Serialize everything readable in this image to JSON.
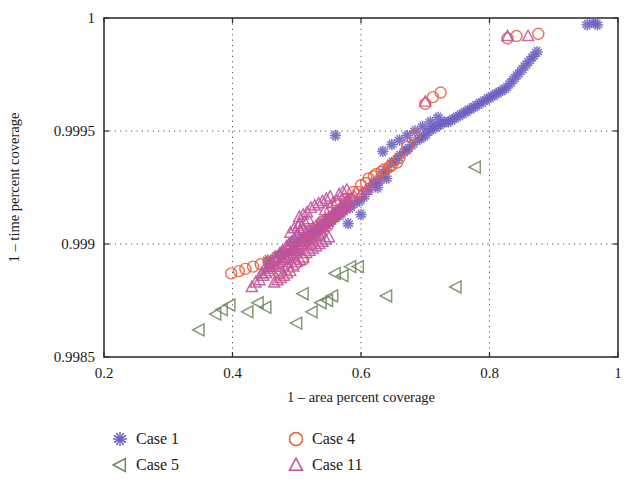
{
  "chart_data": {
    "type": "scatter",
    "title": "",
    "xlabel": "1 – area percent coverage",
    "ylabel": "1 – time percent coverage",
    "xlim": [
      0.2,
      1.0
    ],
    "ylim": [
      0.9985,
      1.0
    ],
    "xticks": [
      "0.2",
      "0.4",
      "0.6",
      "0.8",
      "1"
    ],
    "xtick_values": [
      0.2,
      0.4,
      0.6,
      0.8,
      1.0
    ],
    "yticks": [
      "0.9985",
      "0.999",
      "0.9995",
      "1"
    ],
    "ytick_values": [
      0.9985,
      0.999,
      0.9995,
      1.0
    ],
    "grid": "dotted",
    "grid_color": "#555555",
    "legend_position": "below-plot",
    "series": [
      {
        "name": "Case 1",
        "marker": "asterisk",
        "color": "#6b5fbf",
        "points": [
          [
            0.455,
            0.99893
          ],
          [
            0.47,
            0.99895
          ],
          [
            0.478,
            0.99896
          ],
          [
            0.492,
            0.999
          ],
          [
            0.5,
            0.99901
          ],
          [
            0.508,
            0.99903
          ],
          [
            0.515,
            0.99903
          ],
          [
            0.523,
            0.99905
          ],
          [
            0.53,
            0.99906
          ],
          [
            0.538,
            0.99907
          ],
          [
            0.545,
            0.99908
          ],
          [
            0.552,
            0.9991
          ],
          [
            0.56,
            0.99912
          ],
          [
            0.568,
            0.99913
          ],
          [
            0.575,
            0.99915
          ],
          [
            0.56,
            0.99948
          ],
          [
            0.583,
            0.99916
          ],
          [
            0.59,
            0.99918
          ],
          [
            0.598,
            0.99919
          ],
          [
            0.605,
            0.99921
          ],
          [
            0.612,
            0.99924
          ],
          [
            0.62,
            0.99927
          ],
          [
            0.628,
            0.99928
          ],
          [
            0.634,
            0.99931
          ],
          [
            0.64,
            0.99933
          ],
          [
            0.648,
            0.99936
          ],
          [
            0.654,
            0.99937
          ],
          [
            0.66,
            0.99939
          ],
          [
            0.668,
            0.99941
          ],
          [
            0.673,
            0.99942
          ],
          [
            0.68,
            0.99944
          ],
          [
            0.688,
            0.99946
          ],
          [
            0.694,
            0.99947
          ],
          [
            0.7,
            0.99948
          ],
          [
            0.706,
            0.9995
          ],
          [
            0.712,
            0.99951
          ],
          [
            0.718,
            0.99952
          ],
          [
            0.724,
            0.99953
          ],
          [
            0.73,
            0.99954
          ],
          [
            0.736,
            0.99954
          ],
          [
            0.742,
            0.99955
          ],
          [
            0.748,
            0.99956
          ],
          [
            0.754,
            0.99957
          ],
          [
            0.76,
            0.99958
          ],
          [
            0.766,
            0.99959
          ],
          [
            0.772,
            0.9996
          ],
          [
            0.778,
            0.99961
          ],
          [
            0.784,
            0.99962
          ],
          [
            0.79,
            0.99963
          ],
          [
            0.796,
            0.99964
          ],
          [
            0.802,
            0.99965
          ],
          [
            0.808,
            0.99966
          ],
          [
            0.814,
            0.99967
          ],
          [
            0.82,
            0.99968
          ],
          [
            0.826,
            0.99969
          ],
          [
            0.832,
            0.99971
          ],
          [
            0.838,
            0.99973
          ],
          [
            0.844,
            0.99975
          ],
          [
            0.85,
            0.99977
          ],
          [
            0.856,
            0.99979
          ],
          [
            0.862,
            0.99981
          ],
          [
            0.868,
            0.99983
          ],
          [
            0.874,
            0.99985
          ],
          [
            0.952,
            0.99997
          ],
          [
            0.962,
            0.99998
          ],
          [
            0.968,
            0.99997
          ],
          [
            0.634,
            0.99941
          ],
          [
            0.648,
            0.99944
          ],
          [
            0.66,
            0.99946
          ],
          [
            0.672,
            0.99948
          ],
          [
            0.684,
            0.9995
          ],
          [
            0.696,
            0.99952
          ],
          [
            0.708,
            0.99954
          ],
          [
            0.72,
            0.99956
          ],
          [
            0.626,
            0.99925
          ],
          [
            0.64,
            0.99929
          ],
          [
            0.6,
            0.99913
          ],
          [
            0.58,
            0.99909
          ]
        ]
      },
      {
        "name": "Case 4",
        "marker": "circle",
        "color": "#e8603c",
        "points": [
          [
            0.398,
            0.99887
          ],
          [
            0.41,
            0.99888
          ],
          [
            0.42,
            0.99889
          ],
          [
            0.432,
            0.9989
          ],
          [
            0.444,
            0.99891
          ],
          [
            0.456,
            0.99892
          ],
          [
            0.468,
            0.99894
          ],
          [
            0.48,
            0.99896
          ],
          [
            0.492,
            0.99898
          ],
          [
            0.504,
            0.999
          ],
          [
            0.516,
            0.99903
          ],
          [
            0.528,
            0.99906
          ],
          [
            0.54,
            0.9991
          ],
          [
            0.552,
            0.99914
          ],
          [
            0.564,
            0.99917
          ],
          [
            0.576,
            0.9992
          ],
          [
            0.588,
            0.99923
          ],
          [
            0.6,
            0.99926
          ],
          [
            0.612,
            0.99929
          ],
          [
            0.624,
            0.99931
          ],
          [
            0.636,
            0.99933
          ],
          [
            0.648,
            0.99935
          ],
          [
            0.66,
            0.99938
          ],
          [
            0.672,
            0.99943
          ],
          [
            0.684,
            0.99948
          ],
          [
            0.7,
            0.99962
          ],
          [
            0.712,
            0.99965
          ],
          [
            0.724,
            0.99967
          ],
          [
            0.828,
            0.99991
          ],
          [
            0.842,
            0.99992
          ],
          [
            0.876,
            0.99993
          ],
          [
            0.524,
            0.999
          ],
          [
            0.536,
            0.99904
          ],
          [
            0.548,
            0.99908
          ],
          [
            0.56,
            0.99912
          ],
          [
            0.572,
            0.99916
          ],
          [
            0.584,
            0.9992
          ],
          [
            0.596,
            0.99923
          ],
          [
            0.608,
            0.99927
          ],
          [
            0.62,
            0.9993
          ],
          [
            0.632,
            0.99932
          ],
          [
            0.644,
            0.99934
          ],
          [
            0.656,
            0.99936
          ],
          [
            0.51,
            0.99893
          ],
          [
            0.498,
            0.99891
          ],
          [
            0.486,
            0.99889
          ],
          [
            0.474,
            0.99887
          ]
        ]
      },
      {
        "name": "Case 5",
        "marker": "triangle-left",
        "color": "#6f8760",
        "points": [
          [
            0.348,
            0.99862
          ],
          [
            0.374,
            0.99869
          ],
          [
            0.384,
            0.99871
          ],
          [
            0.396,
            0.99873
          ],
          [
            0.424,
            0.9987
          ],
          [
            0.44,
            0.99874
          ],
          [
            0.452,
            0.99872
          ],
          [
            0.5,
            0.99865
          ],
          [
            0.51,
            0.99878
          ],
          [
            0.524,
            0.9987
          ],
          [
            0.548,
            0.99875
          ],
          [
            0.556,
            0.99877
          ],
          [
            0.572,
            0.99886
          ],
          [
            0.584,
            0.9989
          ],
          [
            0.596,
            0.9989
          ],
          [
            0.64,
            0.99877
          ],
          [
            0.748,
            0.99881
          ],
          [
            0.778,
            0.99934
          ],
          [
            0.56,
            0.99887
          ],
          [
            0.538,
            0.99874
          ]
        ]
      },
      {
        "name": "Case 11",
        "marker": "triangle-up",
        "color": "#c0529b",
        "points": [
          [
            0.43,
            0.99881
          ],
          [
            0.436,
            0.99883
          ],
          [
            0.442,
            0.99884
          ],
          [
            0.448,
            0.99886
          ],
          [
            0.452,
            0.99887
          ],
          [
            0.456,
            0.99888
          ],
          [
            0.46,
            0.99889
          ],
          [
            0.464,
            0.9989
          ],
          [
            0.468,
            0.9989
          ],
          [
            0.472,
            0.99891
          ],
          [
            0.474,
            0.99892
          ],
          [
            0.478,
            0.99892
          ],
          [
            0.48,
            0.99893
          ],
          [
            0.482,
            0.99894
          ],
          [
            0.484,
            0.99894
          ],
          [
            0.486,
            0.99895
          ],
          [
            0.488,
            0.99895
          ],
          [
            0.49,
            0.99896
          ],
          [
            0.492,
            0.99896
          ],
          [
            0.494,
            0.99897
          ],
          [
            0.496,
            0.99897
          ],
          [
            0.498,
            0.99898
          ],
          [
            0.5,
            0.99898
          ],
          [
            0.502,
            0.99899
          ],
          [
            0.504,
            0.99899
          ],
          [
            0.506,
            0.999
          ],
          [
            0.508,
            0.999
          ],
          [
            0.51,
            0.99901
          ],
          [
            0.512,
            0.99901
          ],
          [
            0.514,
            0.99902
          ],
          [
            0.516,
            0.99902
          ],
          [
            0.518,
            0.99903
          ],
          [
            0.52,
            0.99903
          ],
          [
            0.522,
            0.99904
          ],
          [
            0.524,
            0.99904
          ],
          [
            0.526,
            0.99905
          ],
          [
            0.528,
            0.99905
          ],
          [
            0.53,
            0.99906
          ],
          [
            0.532,
            0.99906
          ],
          [
            0.534,
            0.99907
          ],
          [
            0.536,
            0.99907
          ],
          [
            0.538,
            0.99908
          ],
          [
            0.54,
            0.99908
          ],
          [
            0.542,
            0.99909
          ],
          [
            0.544,
            0.99909
          ],
          [
            0.546,
            0.9991
          ],
          [
            0.548,
            0.9991
          ],
          [
            0.55,
            0.99911
          ],
          [
            0.552,
            0.99911
          ],
          [
            0.554,
            0.99912
          ],
          [
            0.556,
            0.99912
          ],
          [
            0.558,
            0.99913
          ],
          [
            0.56,
            0.99913
          ],
          [
            0.562,
            0.99914
          ],
          [
            0.564,
            0.99914
          ],
          [
            0.566,
            0.99915
          ],
          [
            0.568,
            0.99915
          ],
          [
            0.57,
            0.99916
          ],
          [
            0.572,
            0.99916
          ],
          [
            0.574,
            0.99917
          ],
          [
            0.576,
            0.99917
          ],
          [
            0.578,
            0.99918
          ],
          [
            0.58,
            0.99918
          ],
          [
            0.49,
            0.99888
          ],
          [
            0.495,
            0.9989
          ],
          [
            0.5,
            0.99892
          ],
          [
            0.505,
            0.99893
          ],
          [
            0.51,
            0.99894
          ],
          [
            0.515,
            0.99896
          ],
          [
            0.52,
            0.99897
          ],
          [
            0.525,
            0.99898
          ],
          [
            0.53,
            0.99899
          ],
          [
            0.535,
            0.999
          ],
          [
            0.54,
            0.99901
          ],
          [
            0.545,
            0.99902
          ],
          [
            0.55,
            0.99903
          ],
          [
            0.47,
            0.99884
          ],
          [
            0.475,
            0.99885
          ],
          [
            0.48,
            0.99886
          ],
          [
            0.485,
            0.99887
          ],
          [
            0.465,
            0.99883
          ],
          [
            0.515,
            0.99905
          ],
          [
            0.52,
            0.99906
          ],
          [
            0.525,
            0.99907
          ],
          [
            0.53,
            0.99908
          ],
          [
            0.535,
            0.99909
          ],
          [
            0.54,
            0.9991
          ],
          [
            0.545,
            0.99911
          ],
          [
            0.55,
            0.99912
          ],
          [
            0.555,
            0.99913
          ],
          [
            0.56,
            0.99914
          ],
          [
            0.565,
            0.99915
          ],
          [
            0.57,
            0.99917
          ],
          [
            0.575,
            0.99918
          ],
          [
            0.58,
            0.99919
          ],
          [
            0.585,
            0.9992
          ],
          [
            0.59,
            0.99921
          ],
          [
            0.5,
            0.99904
          ],
          [
            0.505,
            0.99906
          ],
          [
            0.51,
            0.99907
          ],
          [
            0.496,
            0.99902
          ],
          [
            0.492,
            0.99901
          ],
          [
            0.488,
            0.999
          ],
          [
            0.484,
            0.99899
          ],
          [
            0.478,
            0.99897
          ],
          [
            0.474,
            0.99896
          ],
          [
            0.47,
            0.99894
          ],
          [
            0.466,
            0.99893
          ],
          [
            0.462,
            0.99892
          ],
          [
            0.458,
            0.99891
          ],
          [
            0.6,
            0.99922
          ],
          [
            0.608,
            0.99924
          ],
          [
            0.616,
            0.99926
          ],
          [
            0.624,
            0.99928
          ],
          [
            0.504,
            0.99912
          ],
          [
            0.51,
            0.99913
          ],
          [
            0.516,
            0.99914
          ],
          [
            0.522,
            0.99916
          ],
          [
            0.528,
            0.99917
          ],
          [
            0.534,
            0.99918
          ],
          [
            0.54,
            0.99919
          ],
          [
            0.546,
            0.9992
          ],
          [
            0.552,
            0.99921
          ],
          [
            0.455,
            0.9989
          ],
          [
            0.45,
            0.99889
          ],
          [
            0.445,
            0.99887
          ],
          [
            0.505,
            0.99909
          ],
          [
            0.512,
            0.9991
          ],
          [
            0.518,
            0.99911
          ],
          [
            0.828,
            0.99992
          ],
          [
            0.86,
            0.99992
          ],
          [
            0.7,
            0.99963
          ],
          [
            0.566,
            0.99922
          ],
          [
            0.572,
            0.99923
          ],
          [
            0.578,
            0.99924
          ],
          [
            0.556,
            0.99918
          ],
          [
            0.562,
            0.99919
          ],
          [
            0.544,
            0.99915
          ],
          [
            0.49,
            0.99905
          ],
          [
            0.496,
            0.99907
          ],
          [
            0.502,
            0.99908
          ]
        ]
      }
    ]
  },
  "legend": {
    "entries": [
      {
        "label": "Case 1",
        "marker": "asterisk",
        "color": "#6b5fbf"
      },
      {
        "label": "Case 4",
        "marker": "circle",
        "color": "#e8603c"
      },
      {
        "label": "Case 5",
        "marker": "triangle-left",
        "color": "#6f8760"
      },
      {
        "label": "Case 11",
        "marker": "triangle-up",
        "color": "#c0529b"
      }
    ]
  },
  "geometry": {
    "plot_left": 104,
    "plot_right": 618,
    "plot_top": 18,
    "plot_bottom": 357
  }
}
